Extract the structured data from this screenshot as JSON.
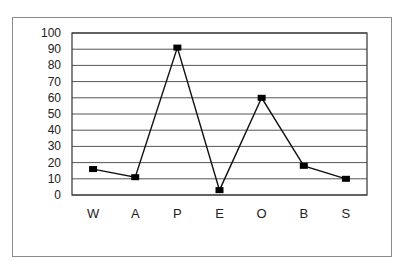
{
  "chart_data": {
    "type": "line",
    "title": "",
    "xlabel": "",
    "ylabel": "",
    "categories": [
      "W",
      "A",
      "P",
      "E",
      "O",
      "B",
      "S"
    ],
    "values": [
      16,
      11,
      91,
      3,
      60,
      18,
      10
    ],
    "ylim": [
      0,
      100
    ],
    "yticks": [
      0,
      10,
      20,
      30,
      40,
      50,
      60,
      70,
      80,
      90,
      100
    ],
    "grid": true,
    "legend": null,
    "marker": "square",
    "line_color": "#111111"
  }
}
